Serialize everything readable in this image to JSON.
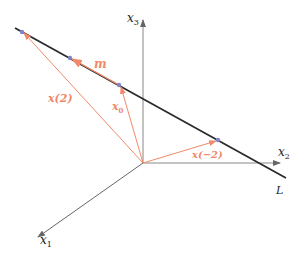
{
  "diagram": {
    "axes": {
      "x1": {
        "label": "x",
        "sub": "1"
      },
      "x2": {
        "label": "x",
        "sub": "2"
      },
      "x3": {
        "label": "x",
        "sub": "3"
      }
    },
    "line": {
      "label": "L"
    },
    "vectors": {
      "m": {
        "label": "m"
      },
      "x0": {
        "label": "x",
        "sub": "0"
      },
      "x2": {
        "label": "x(2)"
      },
      "xneg2": {
        "label": "x(−2)"
      }
    },
    "colors": {
      "axis": "#777777",
      "line": "#2b2b2b",
      "vector": "#f08a6a",
      "point": "#7f86c8"
    }
  }
}
